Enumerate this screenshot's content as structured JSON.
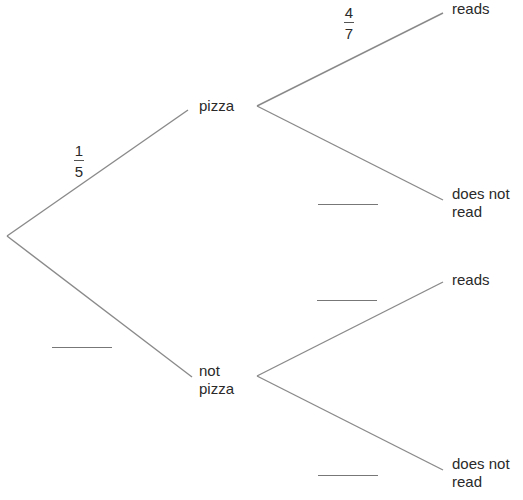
{
  "diagram": {
    "type": "probability-tree",
    "line_color": "#8a8a8a",
    "nodes": {
      "pizza": "pizza",
      "not_pizza_line1": "not",
      "not_pizza_line2": "pizza",
      "pizza_reads": "reads",
      "pizza_not_read_line1": "does not",
      "pizza_not_read_line2": "read",
      "notpizza_reads": "reads",
      "notpizza_not_read_line1": "does not",
      "notpizza_not_read_line2": "read"
    },
    "probabilities": {
      "pizza": {
        "numerator": "1",
        "denominator": "5"
      },
      "pizza_reads": {
        "numerator": "4",
        "denominator": "7"
      },
      "not_pizza": "",
      "pizza_does_not_read": "",
      "notpizza_reads": "",
      "notpizza_does_not_read": ""
    }
  }
}
